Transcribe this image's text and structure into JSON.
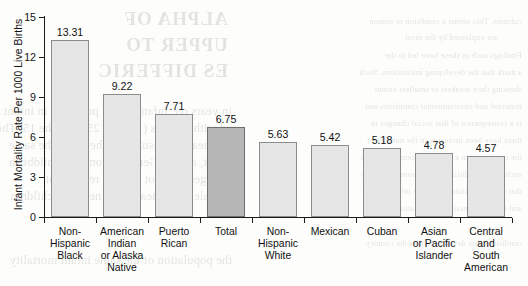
{
  "chart_data": {
    "type": "bar",
    "title": "",
    "xlabel": "",
    "ylabel": "Infant Mortality Rate Per 1000 Live Births",
    "ylim": [
      0,
      15
    ],
    "yticks": [
      0,
      3,
      6,
      9,
      12,
      15
    ],
    "grid": false,
    "legend": "none",
    "categories": [
      "Non-\nHispanic\nBlack",
      "American\nIndian\nor Alaska\nNative",
      "Puerto\nRican",
      "Total",
      "Non-\nHispanic\nWhite",
      "Mexican",
      "Cuban",
      "Asian\nor Pacific\nIslander",
      "Central\nand\nSouth\nAmerican"
    ],
    "values": [
      13.31,
      9.22,
      7.71,
      6.75,
      5.63,
      5.42,
      5.18,
      4.78,
      4.57
    ],
    "value_labels": [
      "13.31",
      "9.22",
      "7.71",
      "6.75",
      "5.63",
      "5.42",
      "5.18",
      "4.78",
      "4.57"
    ],
    "highlight_index": 3,
    "colors": {
      "bar_fill": "#e6e6e6",
      "bar_border": "#8c8c8c",
      "highlight_fill": "#b6b6b6",
      "highlight_border": "#6f6f6f",
      "axis": "#1a1a1a",
      "text": "#111111"
    }
  },
  "scan_bleed": {
    "note": "show-through text from reverse page, mirrored and faint",
    "lines": [
      "cultures. This seems a condition or reason",
      "are explained by the most",
      "Findings such as these have led to the",
      "a mark that the developing institutions. Such",
      "showing their weakest or smallest extent",
      "maternal and environmental conditions and",
      "is a consequence of that social changes in",
      "there have been increases in the number of",
      "the conditions in a similar pattern during the",
      "each other conditions among some countries",
      "that other conditions for these others is very",
      "and can be maintained from national level",
      "conditions that development as the country",
      "ALPHA OF",
      "UPPER TO",
      "ES DIFFERIC",
      "in years on. Infant health problems in infant",
      "ed with persons (1.4-0.2, 25.7) of the 15. Their",
      "and health measured by the data. The same",
      "about, among General. Common childbirth",
      "emerged, but not that the report that",
      "prevalence of health and newborn children",
      "the population of the same infant mortality"
    ]
  }
}
